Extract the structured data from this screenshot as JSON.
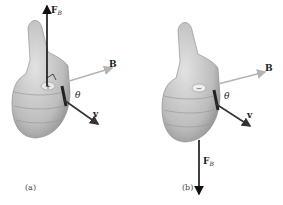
{
  "figure": {
    "panels": [
      {
        "id": "a",
        "caption": "(a)",
        "charge": "+",
        "force_label": "F",
        "force_sub": "B",
        "force_direction": "up",
        "field_label": "B",
        "velocity_label": "v",
        "angle_label": "θ"
      },
      {
        "id": "b",
        "caption": "(b)",
        "charge": "−",
        "force_label": "F",
        "force_sub": "B",
        "force_direction": "down",
        "field_label": "B",
        "velocity_label": "v",
        "angle_label": "θ"
      }
    ],
    "colors": {
      "hand": "#c8c8c8",
      "hand_shadow": "#9a9a9a",
      "force_arrow": "#111111",
      "field_arrow": "#b4b4b4",
      "velocity_arrow": "#333333"
    }
  }
}
